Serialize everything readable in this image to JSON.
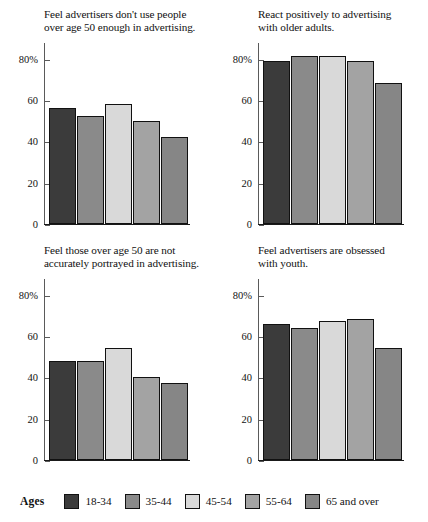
{
  "legend": {
    "title": "Ages",
    "items": [
      {
        "label": "18-34",
        "color": "#3b3b3b"
      },
      {
        "label": "35-44",
        "color": "#8a8a8a"
      },
      {
        "label": "45-54",
        "color": "#d9d9d9"
      },
      {
        "label": "55-64",
        "color": "#a3a3a3"
      },
      {
        "label": "65 and over",
        "color": "#868686"
      }
    ]
  },
  "axis": {
    "ticks": [
      "80%",
      "60",
      "40",
      "20",
      "0"
    ],
    "tick_values": [
      80,
      60,
      40,
      20,
      0
    ],
    "ymin": 0,
    "ymax": 88
  },
  "chart_data": [
    {
      "type": "bar",
      "title": "Feel advertisers don't use people\nover age 50 enough in advertising.",
      "categories": [
        "18-34",
        "35-44",
        "45-54",
        "55-64",
        "65 and over"
      ],
      "values": [
        56,
        52,
        58,
        50,
        42
      ],
      "xlabel": "",
      "ylabel": "",
      "ylim": [
        0,
        88
      ],
      "yticks": [
        0,
        20,
        40,
        60,
        80
      ],
      "ytick_labels": [
        "0",
        "20",
        "40",
        "60",
        "80%"
      ],
      "grid": false,
      "legend_position": "bottom"
    },
    {
      "type": "bar",
      "title": "React positively to advertising\nwith older adults.",
      "categories": [
        "18-34",
        "35-44",
        "45-54",
        "55-64",
        "65 and over"
      ],
      "values": [
        79,
        81,
        81,
        79,
        68
      ],
      "xlabel": "",
      "ylabel": "",
      "ylim": [
        0,
        88
      ],
      "yticks": [
        0,
        20,
        40,
        60,
        80
      ],
      "ytick_labels": [
        "0",
        "20",
        "40",
        "60",
        "80%"
      ],
      "grid": false,
      "legend_position": "bottom"
    },
    {
      "type": "bar",
      "title": "Feel those over age 50 are not\naccurately portrayed in advertising.",
      "categories": [
        "18-34",
        "35-44",
        "45-54",
        "55-64",
        "65 and over"
      ],
      "values": [
        48,
        48,
        54,
        40,
        37
      ],
      "xlabel": "",
      "ylabel": "",
      "ylim": [
        0,
        88
      ],
      "yticks": [
        0,
        20,
        40,
        60,
        80
      ],
      "ytick_labels": [
        "0",
        "20",
        "40",
        "60",
        "80%"
      ],
      "grid": false,
      "legend_position": "bottom"
    },
    {
      "type": "bar",
      "title": "Feel advertisers are obsessed\nwith youth.",
      "categories": [
        "18-34",
        "35-44",
        "45-54",
        "55-64",
        "65 and over"
      ],
      "values": [
        66,
        64,
        67,
        68,
        54
      ],
      "xlabel": "",
      "ylabel": "",
      "ylim": [
        0,
        88
      ],
      "yticks": [
        0,
        20,
        40,
        60,
        80
      ],
      "ytick_labels": [
        "0",
        "20",
        "40",
        "60",
        "80%"
      ],
      "grid": false,
      "legend_position": "bottom"
    }
  ]
}
